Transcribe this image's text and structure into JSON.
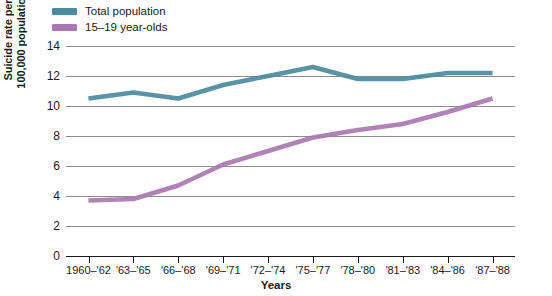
{
  "legend": {
    "position": "top-left",
    "items": [
      {
        "label": "Total population",
        "color": "#4a8b9e",
        "swatch": "legend-swatch-total-population"
      },
      {
        "label": "15–19 year-olds",
        "color": "#a878b0",
        "swatch": "legend-swatch-teen"
      }
    ]
  },
  "axes": {
    "ylabel_line1": "Suicide rate per",
    "ylabel_line2": "100,000 population",
    "xlabel": "Years",
    "yticks": [
      "14",
      "12",
      "10",
      "8",
      "6",
      "4",
      "2",
      "0"
    ]
  },
  "chart_data": {
    "type": "line",
    "title": "",
    "xlabel": "Years",
    "ylabel": "Suicide rate per 100,000 population",
    "categories": [
      "1960–'62",
      "'63–'65",
      "'66–'68",
      "'69–'71",
      "'72–'74",
      "'75–'77",
      "'78–'80",
      "'81–'83",
      "'84–'86",
      "'87–'88"
    ],
    "series": [
      {
        "name": "Total population",
        "color": "#4a8b9e",
        "values": [
          10.5,
          10.9,
          10.5,
          11.4,
          12.0,
          12.6,
          11.8,
          11.8,
          12.2,
          12.2
        ]
      },
      {
        "name": "15–19 year-olds",
        "color": "#a878b0",
        "values": [
          3.7,
          3.8,
          4.7,
          6.1,
          7.0,
          7.9,
          8.4,
          8.8,
          9.6,
          10.5
        ]
      }
    ],
    "ylim": [
      0,
      14
    ],
    "ytick_step": 2,
    "grid": true,
    "legend_position": "top-left"
  }
}
